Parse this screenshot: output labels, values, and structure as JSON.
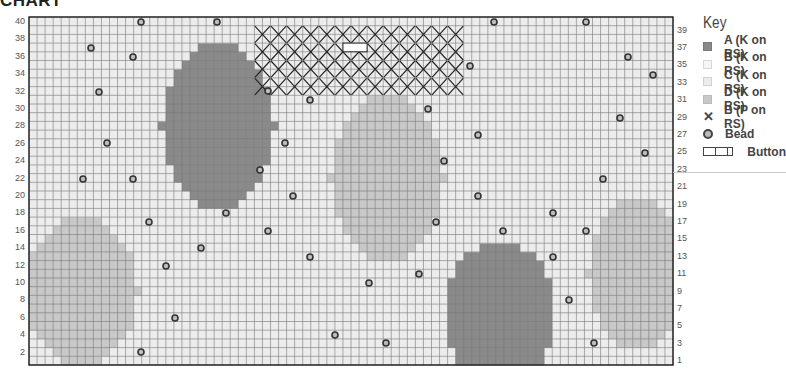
{
  "title": "CHART",
  "key": {
    "title": "Key",
    "items": [
      {
        "symbol": "swatch-a",
        "label": "A (K on RS)"
      },
      {
        "symbol": "swatch-b",
        "label": "B (K on RS)"
      },
      {
        "symbol": "swatch-c",
        "label": "C (K on RS)"
      },
      {
        "symbol": "swatch-d",
        "label": "D (K on RS)"
      },
      {
        "symbol": "x",
        "glyph": "✕",
        "label": "B (P on RS)"
      },
      {
        "symbol": "bead",
        "label": "Bead"
      },
      {
        "symbol": "button",
        "label": "Button"
      }
    ]
  },
  "colors": {
    "A": "#8a8a8a",
    "B": "#f6f6f6",
    "C": "#ececec",
    "D": "#c8c8c8",
    "grid": "#777777",
    "border": "#222222"
  },
  "chart_data": {
    "type": "heatmap",
    "title": "CHART",
    "columns": 80,
    "rows": 40,
    "left_row_labels": [
      2,
      4,
      6,
      8,
      10,
      12,
      14,
      16,
      18,
      20,
      22,
      24,
      26,
      28,
      30,
      32,
      34,
      36,
      38,
      40
    ],
    "right_row_labels": [
      1,
      3,
      5,
      7,
      9,
      11,
      13,
      15,
      17,
      19,
      21,
      23,
      25,
      27,
      29,
      31,
      33,
      35,
      37,
      39
    ],
    "background_color": "C",
    "shapes": [
      {
        "color": "A",
        "cx": 23.5,
        "cy": 27.5,
        "rx": 7,
        "ry": 9.5
      },
      {
        "color": "D",
        "cx": 44.5,
        "cy": 21.5,
        "rx": 7,
        "ry": 9.5
      },
      {
        "color": "D",
        "cx": 6.5,
        "cy": 8.5,
        "rx": 7,
        "ry": 8.5
      },
      {
        "color": "D",
        "cx": 75.5,
        "cy": 10.5,
        "rx": 6,
        "ry": 8.5
      },
      {
        "color": "A",
        "cx": 58.5,
        "cy": 6,
        "rx": 7,
        "ry": 8
      }
    ],
    "purl_region": {
      "symbol": "X",
      "col_start": 28,
      "col_end": 53,
      "row_start": 33,
      "row_end": 40
    },
    "button": {
      "col_start": 39,
      "col_end": 41,
      "row": 37
    },
    "beads_px": [
      [
        141,
        22
      ],
      [
        217,
        22
      ],
      [
        494,
        22
      ],
      [
        586,
        22
      ],
      [
        91,
        48
      ],
      [
        133,
        57
      ],
      [
        628,
        57
      ],
      [
        470,
        66
      ],
      [
        653,
        75
      ],
      [
        99,
        92
      ],
      [
        268,
        91
      ],
      [
        310,
        100
      ],
      [
        428,
        109
      ],
      [
        620,
        118
      ],
      [
        107,
        143
      ],
      [
        285,
        143
      ],
      [
        478,
        135
      ],
      [
        645,
        153
      ],
      [
        444,
        161
      ],
      [
        83,
        179
      ],
      [
        133,
        179
      ],
      [
        260,
        170
      ],
      [
        603,
        179
      ],
      [
        293,
        196
      ],
      [
        478,
        196
      ],
      [
        226,
        213
      ],
      [
        553,
        213
      ],
      [
        149,
        222
      ],
      [
        436,
        222
      ],
      [
        268,
        231
      ],
      [
        503,
        231
      ],
      [
        586,
        231
      ],
      [
        201,
        248
      ],
      [
        310,
        257
      ],
      [
        553,
        257
      ],
      [
        166,
        266
      ],
      [
        419,
        274
      ],
      [
        369,
        283
      ],
      [
        569,
        300
      ],
      [
        175,
        318
      ],
      [
        335,
        335
      ],
      [
        386,
        343
      ],
      [
        594,
        343
      ],
      [
        141,
        352
      ]
    ],
    "legend_position": "right",
    "grid": true
  }
}
